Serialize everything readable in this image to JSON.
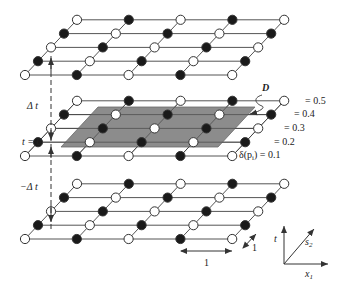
{
  "diagram": {
    "type": "space-time lattice diagram",
    "colors": {
      "background": "#ffffff",
      "line": "#555555",
      "node_dark": "#1a1a1a",
      "node_light": "#ffffff",
      "node_stroke": "#333333",
      "region_fill": "#8c8c8c",
      "region_stroke": "#6a6a6a"
    },
    "lattice": {
      "rows": 5,
      "cols": 5,
      "pattern": "checkerboard",
      "row_pattern_front_to_back": [
        [
          "white",
          "black",
          "white",
          "black",
          "white"
        ],
        [
          "black",
          "white",
          "black",
          "white",
          "black"
        ],
        [
          "white",
          "black",
          "white",
          "black",
          "white"
        ],
        [
          "black",
          "white",
          "black",
          "white",
          "black"
        ],
        [
          "white",
          "black",
          "white",
          "black",
          "white"
        ]
      ]
    },
    "layers": [
      {
        "id": "top",
        "label": "",
        "front_y": 75
      },
      {
        "id": "middle",
        "label": "t = 0",
        "front_y": 156
      },
      {
        "id": "bottom",
        "label": "",
        "front_y": 239
      }
    ],
    "time_labels": {
      "plus": "Δ t",
      "zero": "t = 0",
      "minus": "−Δ t"
    },
    "region": {
      "label": "D"
    },
    "level_labels": [
      "= 0.5",
      "= 0.4",
      "= 0.3",
      "= 0.2",
      "δ(p",
      ") = 0.1"
    ],
    "level_label_subscript": "i",
    "scale_labels": {
      "horizontal": "1",
      "depth": "1"
    },
    "axes": {
      "vertical": "t",
      "diagonal": "s",
      "diagonal_sub": "2",
      "horizontal": "x",
      "horizontal_sub": "1"
    }
  }
}
